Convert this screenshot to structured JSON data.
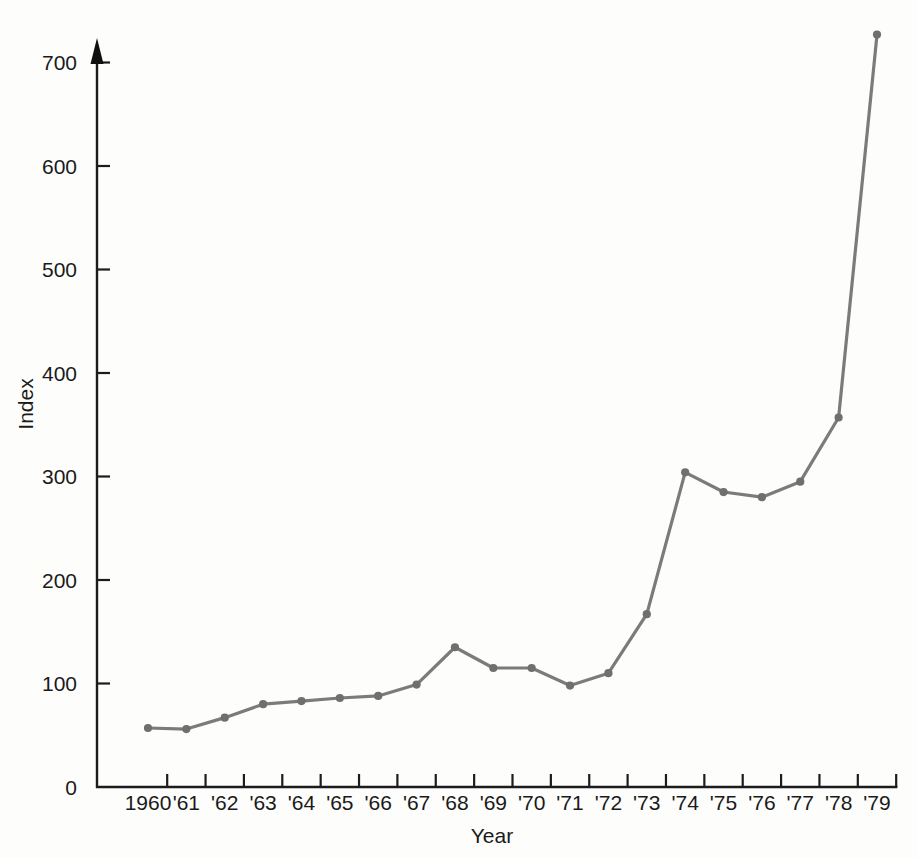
{
  "figure": {
    "background_color": "#fdfdfc",
    "line_color": "#7b7b7b",
    "axis_color": "#1c1c1c",
    "text_color": "#1a1a1a"
  },
  "chart_data": {
    "type": "line",
    "title": "",
    "xlabel": "Year",
    "ylabel": "Index",
    "categories": [
      "1960",
      "'61",
      "'62",
      "'63",
      "'64",
      "'65",
      "'66",
      "'67",
      "'68",
      "'69",
      "'70",
      "'71",
      "'72",
      "'73",
      "'74",
      "'75",
      "'76",
      "'77",
      "'78",
      "'79"
    ],
    "values": [
      57,
      56,
      67,
      80,
      83,
      86,
      88,
      99,
      135,
      115,
      115,
      98,
      110,
      167,
      304,
      285,
      280,
      295,
      357,
      727
    ],
    "ylim": [
      0,
      750
    ],
    "yticks": [
      0,
      100,
      200,
      300,
      400,
      500,
      600,
      700
    ],
    "ytick_labels": [
      "0",
      "100",
      "200",
      "300",
      "400",
      "500",
      "600",
      "700"
    ],
    "xtick_labels": [
      "1960",
      "'61",
      "'62",
      "'63",
      "'64",
      "'65",
      "'66",
      "'67",
      "'68",
      "'69",
      "'70",
      "'71",
      "'72",
      "'73",
      "'74",
      "'75",
      "'76",
      "'77",
      "'78",
      "'79"
    ],
    "grid": false,
    "legend": null,
    "marker": "circle",
    "y_axis_arrow": true
  }
}
